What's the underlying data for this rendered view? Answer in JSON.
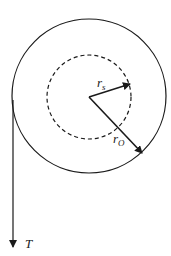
{
  "diagram": {
    "type": "pulley-radius-diagram",
    "labels": {
      "inner_radius": "r",
      "inner_radius_sub": "s",
      "outer_radius": "r",
      "outer_radius_sub": "O",
      "tension": "T"
    },
    "outer_circle": {
      "cx": 89,
      "cy": 96,
      "r": 77,
      "style": "solid"
    },
    "inner_circle": {
      "cx": 89,
      "cy": 97,
      "r": 42,
      "style": "dashed"
    },
    "colors": {
      "stroke": "#1a1a1a",
      "background": "#ffffff"
    }
  }
}
